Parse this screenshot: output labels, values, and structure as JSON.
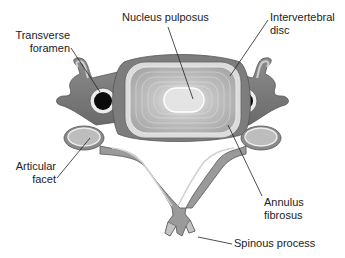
{
  "diagram": {
    "labels": {
      "nucleus_pulposus": "Nucleus pulposus",
      "intervertebral_disc_line1": "Intervertebral",
      "intervertebral_disc_line2": "disc",
      "transverse_foramen_line1": "Transverse",
      "transverse_foramen_line2": "foramen",
      "articular_facet_line1": "Articular",
      "articular_facet_line2": "facet",
      "annulus_fibrosus_line1": "Annulus",
      "annulus_fibrosus_line2": "fibrosus",
      "spinous_process": "Spinous process"
    },
    "colors": {
      "bone_dark": "#6e6e6e",
      "bone_mid": "#9a9a9a",
      "bone_light": "#c8c8c8",
      "disc_fill": "#b5b5b5",
      "nucleus": "#e2e2e2",
      "foramen": "#0a0a0a",
      "leader_line": "#222222"
    }
  }
}
